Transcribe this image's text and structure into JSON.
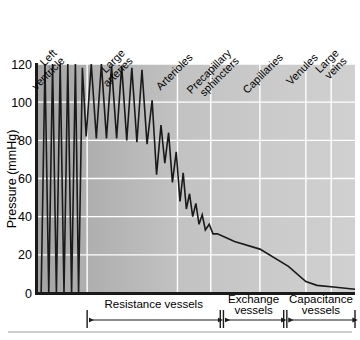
{
  "chart_data": {
    "type": "line",
    "title": "",
    "subtitle": "",
    "xlabel": "",
    "ylabel": "Pressure (mmHg)",
    "ylim": [
      0,
      120
    ],
    "yticks": [
      0,
      20,
      40,
      60,
      80,
      100,
      120
    ],
    "ytick_labels": [
      "0",
      "20",
      "40",
      "60",
      "80",
      "100",
      "120"
    ],
    "grid": "horizontal-and-vertical-white",
    "legend": "none",
    "x_axis_type": "categorical-segments",
    "categories": [
      "Left ventricle",
      "Large arteries",
      "Arterioles",
      "Precapillary sphincters",
      "Capillaries",
      "Venules",
      "Large veins"
    ],
    "category_label_rotation_deg": -45,
    "segment_boundaries_x": [
      0.0,
      0.155,
      0.44,
      0.545,
      0.7,
      0.845,
      0.925,
      1.0
    ],
    "series": [
      {
        "name": "Blood pressure profile",
        "color": "#1a1a1a",
        "description": "Pulsatile ventricular spikes, damped arterial pulse pressure, steep arteriolar drop, then gradual venous decline to near zero",
        "points": [
          [
            0.01,
            0
          ],
          [
            0.022,
            120
          ],
          [
            0.034,
            0
          ],
          [
            0.046,
            120
          ],
          [
            0.058,
            0
          ],
          [
            0.07,
            120
          ],
          [
            0.082,
            0
          ],
          [
            0.094,
            120
          ],
          [
            0.106,
            0
          ],
          [
            0.118,
            120
          ],
          [
            0.128,
            0
          ],
          [
            0.14,
            118
          ],
          [
            0.152,
            82
          ],
          [
            0.168,
            120
          ],
          [
            0.184,
            81
          ],
          [
            0.2,
            120
          ],
          [
            0.216,
            81
          ],
          [
            0.232,
            119
          ],
          [
            0.248,
            81
          ],
          [
            0.264,
            119
          ],
          [
            0.28,
            80
          ],
          [
            0.296,
            118
          ],
          [
            0.312,
            79
          ],
          [
            0.328,
            117
          ],
          [
            0.344,
            78
          ],
          [
            0.36,
            101
          ],
          [
            0.374,
            62
          ],
          [
            0.388,
            88
          ],
          [
            0.4,
            68
          ],
          [
            0.412,
            84
          ],
          [
            0.424,
            58
          ],
          [
            0.436,
            74
          ],
          [
            0.448,
            48
          ],
          [
            0.458,
            63
          ],
          [
            0.468,
            44
          ],
          [
            0.478,
            52
          ],
          [
            0.488,
            40
          ],
          [
            0.498,
            47
          ],
          [
            0.508,
            36
          ],
          [
            0.518,
            41
          ],
          [
            0.528,
            33
          ],
          [
            0.54,
            36
          ],
          [
            0.552,
            31
          ],
          [
            0.566,
            31
          ],
          [
            0.62,
            27
          ],
          [
            0.7,
            23
          ],
          [
            0.79,
            14
          ],
          [
            0.845,
            6
          ],
          [
            0.88,
            4
          ],
          [
            0.94,
            3
          ],
          [
            1.0,
            2
          ]
        ]
      }
    ],
    "annotations": {
      "groups": [
        {
          "label_line1": "Resistance vessels",
          "label_line2": "",
          "start_x": 0.155,
          "end_x": 0.575
        },
        {
          "label_line1": "Exchange",
          "label_line2": "vessels",
          "start_x": 0.585,
          "end_x": 0.775
        },
        {
          "label_line1": "Capacitance",
          "label_line2": "vessels",
          "start_x": 0.785,
          "end_x": 1.0
        }
      ],
      "arrow_style": "double-headed-with-end-ticks"
    },
    "style": {
      "plot_background": "grey-gradient-dark-left-to-light-right",
      "plot_bg_left": "#a8a8a8",
      "plot_bg_right": "#cfcfcf",
      "gridline_color": "#ffffff",
      "axis_frame_color": "#1a1a1a",
      "line_color": "#1a1a1a",
      "page_background": "#ffffff",
      "footer_rule_color": "#999999"
    }
  }
}
